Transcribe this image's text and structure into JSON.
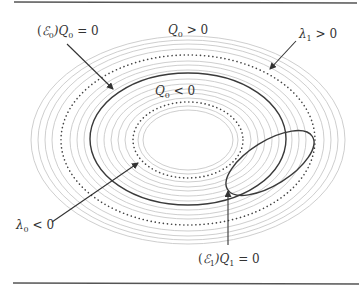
{
  "figure": {
    "labels": {
      "e0_q0": {
        "prefix": "(",
        "script": "ℰ",
        "script_sub": "0",
        "mid": ")Q",
        "sub": "0",
        "rel": " = 0"
      },
      "q0_pos": {
        "var": "Q",
        "sub": "0",
        "rel": " > 0"
      },
      "q0_neg": {
        "var": "Q",
        "sub": "0",
        "rel": " < 0"
      },
      "lambda1": {
        "var": "λ",
        "sub": "1",
        "rel": " > 0"
      },
      "lambda0": {
        "var": "λ",
        "sub": "0",
        "rel": " < 0"
      },
      "e1_q1": {
        "prefix": "(",
        "script": "ℰ",
        "script_sub": "1",
        "mid": ")Q",
        "sub": "1",
        "rel": " = 0"
      }
    },
    "colors": {
      "ring": "#c8c8c8",
      "solid": "#3a3a3a",
      "dots": "#444444",
      "rule": "#555555",
      "text": "#333333"
    }
  }
}
